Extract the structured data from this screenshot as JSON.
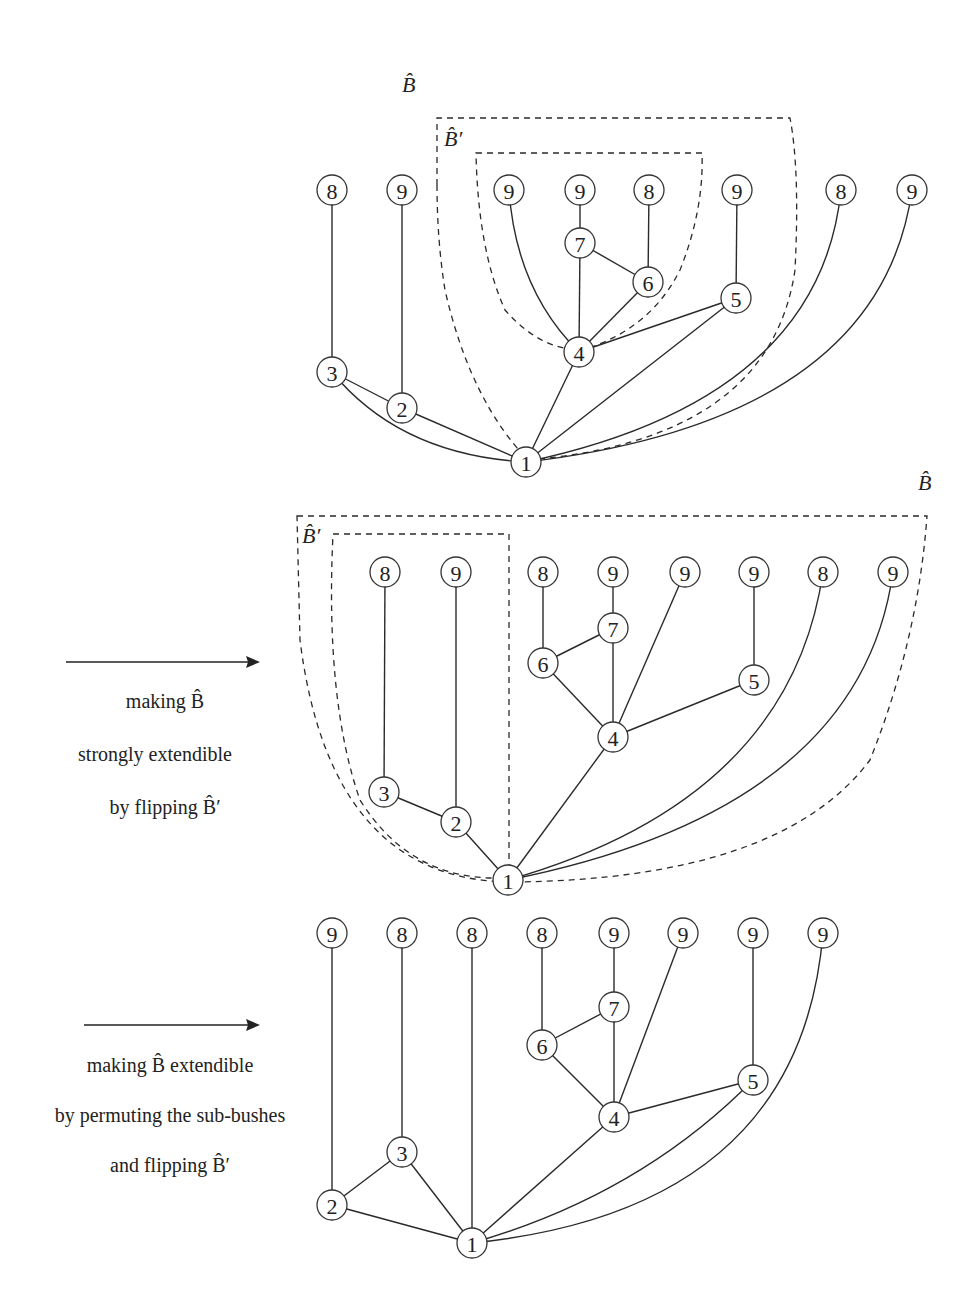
{
  "labels": {
    "b_hat": "B̂",
    "b_hat_prime": "B̂′"
  },
  "steps": [
    {
      "lines": [
        "making B̂",
        "strongly extendible",
        "by flipping B̂′"
      ]
    },
    {
      "lines": [
        "making B̂ extendible",
        "by permuting the sub-bushes",
        "and flipping B̂′"
      ]
    }
  ],
  "diagrams": [
    {
      "name": "original",
      "nodes": [
        {
          "id": "a1",
          "label": "8"
        },
        {
          "id": "a2",
          "label": "9"
        },
        {
          "id": "a3",
          "label": "9"
        },
        {
          "id": "a4",
          "label": "9"
        },
        {
          "id": "a5",
          "label": "8"
        },
        {
          "id": "a6",
          "label": "9"
        },
        {
          "id": "a7",
          "label": "8"
        },
        {
          "id": "a8",
          "label": "9"
        },
        {
          "id": "n7",
          "label": "7"
        },
        {
          "id": "n6",
          "label": "6"
        },
        {
          "id": "n5",
          "label": "5"
        },
        {
          "id": "n4",
          "label": "4"
        },
        {
          "id": "n3",
          "label": "3"
        },
        {
          "id": "n2",
          "label": "2"
        },
        {
          "id": "n1",
          "label": "1"
        }
      ],
      "edges": [
        [
          "a1",
          "n3"
        ],
        [
          "a2",
          "n2"
        ],
        [
          "n3",
          "n2"
        ],
        [
          "n3",
          "n1"
        ],
        [
          "n2",
          "n1"
        ],
        [
          "a3",
          "n4"
        ],
        [
          "a4",
          "n7"
        ],
        [
          "n7",
          "n4"
        ],
        [
          "n7",
          "n6"
        ],
        [
          "a5",
          "n6"
        ],
        [
          "n6",
          "n4"
        ],
        [
          "a6",
          "n5"
        ],
        [
          "n5",
          "n4"
        ],
        [
          "n5",
          "n1"
        ],
        [
          "n4",
          "n1"
        ],
        [
          "a7",
          "n1"
        ],
        [
          "a8",
          "n1"
        ]
      ]
    },
    {
      "name": "strongly-extendible",
      "nodes": [
        {
          "id": "a1",
          "label": "8"
        },
        {
          "id": "a2",
          "label": "9"
        },
        {
          "id": "a3",
          "label": "8"
        },
        {
          "id": "a4",
          "label": "9"
        },
        {
          "id": "a5",
          "label": "9"
        },
        {
          "id": "a6",
          "label": "9"
        },
        {
          "id": "a7",
          "label": "8"
        },
        {
          "id": "a8",
          "label": "9"
        },
        {
          "id": "n7",
          "label": "7"
        },
        {
          "id": "n6",
          "label": "6"
        },
        {
          "id": "n5",
          "label": "5"
        },
        {
          "id": "n4",
          "label": "4"
        },
        {
          "id": "n3",
          "label": "3"
        },
        {
          "id": "n2",
          "label": "2"
        },
        {
          "id": "n1",
          "label": "1"
        }
      ],
      "edges": [
        [
          "a1",
          "n3"
        ],
        [
          "a2",
          "n2"
        ],
        [
          "n3",
          "n2"
        ],
        [
          "n2",
          "n1"
        ],
        [
          "a3",
          "n6"
        ],
        [
          "a4",
          "n7"
        ],
        [
          "n6",
          "n7"
        ],
        [
          "n6",
          "n4"
        ],
        [
          "n7",
          "n4"
        ],
        [
          "a5",
          "n4"
        ],
        [
          "a6",
          "n5"
        ],
        [
          "n5",
          "n4"
        ],
        [
          "n4",
          "n1"
        ],
        [
          "a7",
          "n1"
        ],
        [
          "a8",
          "n1"
        ]
      ]
    },
    {
      "name": "extendible",
      "nodes": [
        {
          "id": "a1",
          "label": "9"
        },
        {
          "id": "a2",
          "label": "8"
        },
        {
          "id": "a3",
          "label": "8"
        },
        {
          "id": "a4",
          "label": "8"
        },
        {
          "id": "a5",
          "label": "9"
        },
        {
          "id": "a6",
          "label": "9"
        },
        {
          "id": "a7",
          "label": "9"
        },
        {
          "id": "a8",
          "label": "9"
        },
        {
          "id": "n7",
          "label": "7"
        },
        {
          "id": "n6",
          "label": "6"
        },
        {
          "id": "n5",
          "label": "5"
        },
        {
          "id": "n4",
          "label": "4"
        },
        {
          "id": "n3",
          "label": "3"
        },
        {
          "id": "n2",
          "label": "2"
        },
        {
          "id": "n1",
          "label": "1"
        }
      ],
      "edges": [
        [
          "a1",
          "n2"
        ],
        [
          "a2",
          "n3"
        ],
        [
          "n2",
          "n3"
        ],
        [
          "n2",
          "n1"
        ],
        [
          "n3",
          "n1"
        ],
        [
          "a3",
          "n1"
        ],
        [
          "a4",
          "n6"
        ],
        [
          "a5",
          "n7"
        ],
        [
          "n6",
          "n7"
        ],
        [
          "n6",
          "n4"
        ],
        [
          "n7",
          "n4"
        ],
        [
          "a6",
          "n4"
        ],
        [
          "a7",
          "n5"
        ],
        [
          "n5",
          "n4"
        ],
        [
          "n5",
          "n1"
        ],
        [
          "n4",
          "n1"
        ],
        [
          "a8",
          "n1"
        ]
      ]
    }
  ]
}
